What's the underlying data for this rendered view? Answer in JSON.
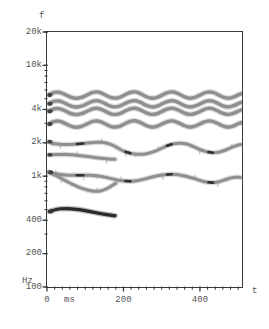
{
  "figure": {
    "axis_f_label": "f",
    "axis_t_label": "t",
    "y_unit": "Hz",
    "x_unit": "ms",
    "frame_color": "#3a3a3a",
    "track_color": "#8f8f8f",
    "track_dark_color": "#2b2b2b",
    "background": "#ffffff",
    "caption_partial": ""
  },
  "y_ticks": [
    {
      "label": "20k",
      "value": 20000
    },
    {
      "label": "10k",
      "value": 10000
    },
    {
      "label": "4k",
      "value": 4000
    },
    {
      "label": "2k",
      "value": 2000
    },
    {
      "label": "1k",
      "value": 1000
    },
    {
      "label": "400",
      "value": 400
    },
    {
      "label": "200",
      "value": 200
    },
    {
      "label": "100",
      "value": 100
    }
  ],
  "x_ticks": [
    {
      "label": "0",
      "value": 0
    },
    {
      "label": "200",
      "value": 200
    },
    {
      "label": "400",
      "value": 400
    }
  ],
  "chart_data": {
    "type": "line",
    "title": "",
    "subtitle": "",
    "xlabel": "t",
    "ylabel": "f",
    "x_unit": "ms",
    "y_unit": "Hz",
    "yscale": "log",
    "xscale": "linear",
    "ylim": [
      100,
      20000
    ],
    "xlim": [
      0,
      510
    ],
    "grid": false,
    "legend": "none",
    "annotations": [],
    "series": [
      {
        "name": "track-8",
        "color": "#8f8f8f",
        "width": 3.4,
        "x": [
          4,
          10,
          20,
          30,
          40,
          50,
          60,
          70,
          80,
          90,
          100,
          110,
          120,
          130,
          140,
          150,
          160,
          170,
          180,
          190,
          200,
          210,
          220,
          230,
          240,
          250,
          260,
          270,
          280,
          290,
          300,
          310,
          320,
          330,
          340,
          350,
          360,
          370,
          380,
          390,
          400,
          410,
          420,
          430,
          440,
          450,
          460,
          470,
          480,
          490,
          500,
          508
        ],
        "y": [
          5400,
          5550,
          5700,
          5720,
          5600,
          5400,
          5200,
          5080,
          5050,
          5130,
          5300,
          5520,
          5700,
          5760,
          5670,
          5460,
          5240,
          5100,
          5060,
          5150,
          5340,
          5560,
          5720,
          5760,
          5650,
          5430,
          5210,
          5080,
          5060,
          5170,
          5370,
          5580,
          5730,
          5750,
          5620,
          5400,
          5190,
          5070,
          5070,
          5190,
          5390,
          5600,
          5740,
          5740,
          5600,
          5380,
          5180,
          5070,
          5080,
          5210,
          5410,
          5550
        ]
      },
      {
        "name": "track-7",
        "color": "#8f8f8f",
        "width": 3.4,
        "x": [
          4,
          10,
          20,
          30,
          40,
          50,
          60,
          70,
          80,
          90,
          100,
          110,
          120,
          130,
          140,
          150,
          160,
          170,
          180,
          190,
          200,
          210,
          220,
          230,
          240,
          250,
          260,
          270,
          280,
          290,
          300,
          310,
          320,
          330,
          340,
          350,
          360,
          370,
          380,
          390,
          400,
          410,
          420,
          430,
          440,
          450,
          460,
          470,
          480,
          490,
          500,
          508
        ],
        "y": [
          4500,
          4620,
          4750,
          4770,
          4670,
          4500,
          4330,
          4230,
          4210,
          4280,
          4420,
          4600,
          4750,
          4800,
          4720,
          4550,
          4370,
          4250,
          4220,
          4290,
          4450,
          4630,
          4760,
          4800,
          4710,
          4530,
          4350,
          4240,
          4220,
          4310,
          4480,
          4650,
          4770,
          4790,
          4680,
          4500,
          4330,
          4230,
          4230,
          4330,
          4490,
          4660,
          4780,
          4780,
          4660,
          4480,
          4310,
          4230,
          4240,
          4350,
          4510,
          4630
        ]
      },
      {
        "name": "track-6",
        "color": "#8f8f8f",
        "width": 3.4,
        "x": [
          4,
          10,
          20,
          30,
          40,
          50,
          60,
          70,
          80,
          90,
          100,
          110,
          120,
          130,
          140,
          150,
          160,
          170,
          180,
          190,
          200,
          210,
          220,
          230,
          240,
          250,
          260,
          270,
          280,
          290,
          300,
          310,
          320,
          330,
          340,
          350,
          360,
          370,
          380,
          390,
          400,
          410,
          420,
          430,
          440,
          450,
          460,
          470,
          480,
          490,
          500,
          508
        ],
        "y": [
          3850,
          3950,
          4060,
          4080,
          3990,
          3850,
          3700,
          3620,
          3600,
          3660,
          3780,
          3930,
          4060,
          4100,
          4030,
          3890,
          3740,
          3630,
          3610,
          3670,
          3800,
          3960,
          4070,
          4100,
          4020,
          3870,
          3720,
          3630,
          3620,
          3690,
          3830,
          3980,
          4080,
          4100,
          4000,
          3850,
          3700,
          3620,
          3620,
          3700,
          3840,
          3990,
          4090,
          4090,
          3980,
          3830,
          3690,
          3620,
          3630,
          3720,
          3860,
          3960
        ]
      },
      {
        "name": "track-5",
        "color": "#8f8f8f",
        "width": 3.4,
        "x": [
          4,
          10,
          20,
          30,
          40,
          50,
          60,
          70,
          80,
          90,
          100,
          110,
          120,
          130,
          140,
          150,
          160,
          170,
          180,
          190,
          200,
          210,
          220,
          230,
          240,
          250,
          260,
          270,
          280,
          290,
          300,
          310,
          320,
          330,
          340,
          350,
          360,
          370,
          380,
          390,
          400,
          410,
          420,
          430,
          440,
          450,
          460,
          470,
          480,
          490,
          500,
          508
        ],
        "y": [
          2950,
          3030,
          3120,
          3140,
          3070,
          2960,
          2850,
          2780,
          2770,
          2820,
          2910,
          3020,
          3120,
          3150,
          3100,
          2990,
          2880,
          2790,
          2780,
          2820,
          2930,
          3050,
          3140,
          3160,
          3090,
          2980,
          2860,
          2790,
          2780,
          2840,
          2950,
          3060,
          3140,
          3150,
          3070,
          2960,
          2850,
          2780,
          2790,
          2850,
          2960,
          3070,
          3140,
          3140,
          3060,
          2950,
          2840,
          2780,
          2790,
          2860,
          2970,
          3040
        ]
      },
      {
        "name": "track-4",
        "color": "#8f8f8f",
        "width": 3.0,
        "x": [
          4,
          12,
          22,
          34,
          48,
          62,
          78,
          95,
          112,
          128,
          142,
          155,
          168,
          180,
          192,
          205,
          218,
          230,
          242,
          254,
          266,
          278,
          290,
          302,
          314,
          326,
          338,
          350,
          362,
          374,
          386,
          398,
          410,
          422,
          434,
          446,
          458,
          470,
          482,
          494,
          506
        ],
        "y": [
          2050,
          1990,
          1960,
          1940,
          1930,
          1935,
          1950,
          1975,
          2000,
          2020,
          2020,
          1990,
          1930,
          1840,
          1740,
          1660,
          1610,
          1585,
          1575,
          1580,
          1610,
          1660,
          1720,
          1800,
          1880,
          1940,
          1975,
          1985,
          1965,
          1910,
          1830,
          1750,
          1690,
          1650,
          1630,
          1640,
          1680,
          1740,
          1810,
          1880,
          1930
        ]
      },
      {
        "name": "track-3",
        "color": "#8f8f8f",
        "width": 3.0,
        "x": [
          4,
          12,
          22,
          34,
          48,
          62,
          78,
          95,
          112,
          128,
          142,
          155,
          168,
          178
        ],
        "y": [
          1560,
          1560,
          1565,
          1570,
          1570,
          1560,
          1545,
          1520,
          1495,
          1470,
          1450,
          1435,
          1425,
          1420
        ]
      },
      {
        "name": "track-2",
        "color": "#8f8f8f",
        "width": 3.0,
        "x": [
          4,
          12,
          22,
          34,
          48,
          62,
          78,
          95,
          112,
          128,
          142,
          155,
          168,
          180,
          192,
          205,
          218,
          230,
          242,
          254,
          266,
          278,
          290,
          302,
          314,
          326,
          338,
          350,
          362,
          374,
          386,
          398,
          410,
          422,
          434,
          446,
          458,
          470,
          482,
          494,
          506
        ],
        "y": [
          1090,
          1070,
          1050,
          1035,
          1025,
          1020,
          1020,
          1020,
          1018,
          1010,
          995,
          975,
          950,
          930,
          915,
          905,
          900,
          905,
          920,
          940,
          965,
          990,
          1010,
          1025,
          1035,
          1040,
          1035,
          1020,
          1000,
          975,
          950,
          920,
          895,
          880,
          875,
          885,
          910,
          940,
          965,
          980,
          975
        ]
      },
      {
        "name": "track-1",
        "color": "#8f8f8f",
        "width": 3.0,
        "x": [
          6,
          14,
          24,
          36,
          50,
          64,
          78,
          92,
          106,
          118,
          130,
          142,
          152,
          162,
          172,
          180
        ],
        "y": [
          1080,
          1050,
          1010,
          960,
          905,
          855,
          810,
          775,
          750,
          735,
          730,
          740,
          760,
          790,
          830,
          860
        ]
      },
      {
        "name": "track-0",
        "color": "#2b2b2b",
        "width": 3.2,
        "x": [
          6,
          14,
          24,
          36,
          50,
          64,
          78,
          92,
          106,
          120,
          134,
          148,
          160,
          170,
          178
        ],
        "y": [
          480,
          490,
          500,
          508,
          510,
          508,
          502,
          494,
          484,
          474,
          464,
          455,
          448,
          443,
          440
        ]
      }
    ]
  }
}
